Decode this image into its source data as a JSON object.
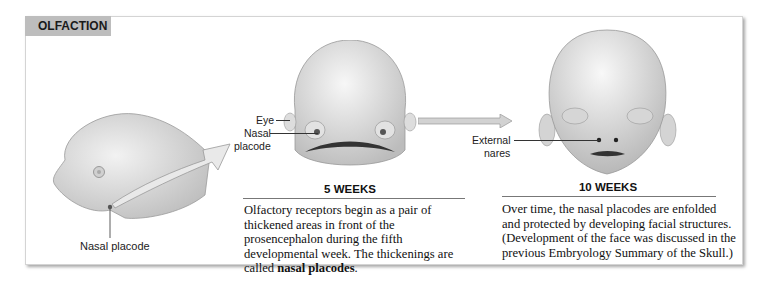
{
  "section": {
    "title": "OLFACTION"
  },
  "labels": {
    "side_nasal_placode": "Nasal placode",
    "eye": "Eye",
    "nasal_placode_line1": "Nasal",
    "nasal_placode_line2": "placode",
    "external_nares_line1": "External",
    "external_nares_line2": "nares"
  },
  "stages": [
    {
      "title": "5 WEEKS",
      "text_before": "Olfactory receptors begin as a pair of thickened areas in front of the prosencephalon during the fifth developmental week. The thickenings are called ",
      "text_bold": "nasal placodes",
      "text_after": "."
    },
    {
      "title": "10 WEEKS",
      "text": "Over time, the nasal placodes are enfolded and protected by developing facial structures. (Development of the face was discussed in the previous Embryology Summary of the Skull.)"
    }
  ],
  "colors": {
    "tab_bg": "#bdbdbd",
    "skin": "#dcdcdc",
    "arrow": "#c8c8c8"
  }
}
